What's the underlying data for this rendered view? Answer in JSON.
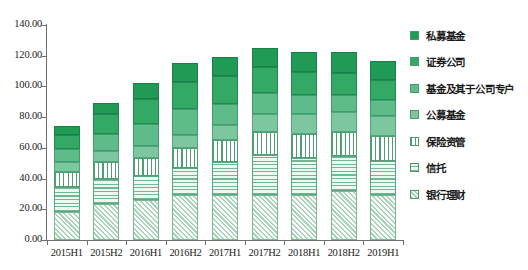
{
  "chart_data": {
    "type": "bar",
    "subtype": "stacked-vertical",
    "title": "",
    "xlabel": "",
    "ylabel": "",
    "ylim": [
      0,
      140
    ],
    "ytick_step": 20,
    "ytick_labels": [
      "0.00",
      "20.00",
      "40.00",
      "60.00",
      "80.00",
      "100.00",
      "120.00",
      "140.00"
    ],
    "grid": false,
    "legend_position": "right",
    "categories": [
      "2015H1",
      "2015H2",
      "2016H1",
      "2016H2",
      "2017H1",
      "2017H2",
      "2018H1",
      "2018H2",
      "2019H1"
    ],
    "series": [
      {
        "name": "银行理财",
        "key": "yinhang",
        "color": "#a9d3bb",
        "pattern": "diagonal-hatch",
        "values": [
          18.4,
          23.5,
          26.3,
          29.1,
          29.1,
          29.5,
          29.1,
          32.1,
          29.0
        ]
      },
      {
        "name": "信托",
        "key": "xintuo",
        "color": "#6fb894",
        "pattern": "horizontal-lines",
        "values": [
          15.9,
          16.3,
          15.3,
          17.5,
          21.9,
          26.0,
          24.6,
          22.7,
          22.5
        ]
      },
      {
        "name": "保险资管",
        "key": "baoxian",
        "color": "#ffffff",
        "pattern": "vertical-lines",
        "values": [
          10.1,
          10.9,
          12.0,
          13.2,
          14.0,
          15.0,
          15.2,
          15.5,
          16.0
        ]
      },
      {
        "name": "公募基金",
        "key": "gongmu",
        "color": "#7cc6a0",
        "pattern": "solid",
        "values": [
          6.5,
          7.3,
          7.9,
          8.8,
          10.0,
          11.6,
          12.9,
          13.0,
          13.4
        ]
      },
      {
        "name": "基金及其于公司专户",
        "key": "zhuanhu",
        "color": "#5fbb8a",
        "pattern": "solid",
        "values": [
          8.4,
          11.2,
          14.3,
          16.5,
          13.7,
          13.4,
          12.4,
          11.4,
          10.2
        ]
      },
      {
        "name": "证券公司",
        "key": "zhengquan",
        "color": "#34a965",
        "pattern": "solid",
        "values": [
          9.0,
          12.8,
          15.8,
          18.0,
          18.1,
          16.9,
          15.3,
          14.3,
          12.8
        ]
      },
      {
        "name": "私募基金",
        "key": "simu",
        "color": "#219a56",
        "pattern": "solid",
        "values": [
          6.2,
          7.5,
          10.8,
          12.0,
          12.3,
          12.7,
          13.2,
          13.2,
          12.5
        ]
      }
    ],
    "totals": [
      74.5,
      89.5,
      102.4,
      115.1,
      119.1,
      125.1,
      122.7,
      122.2,
      116.4
    ]
  }
}
